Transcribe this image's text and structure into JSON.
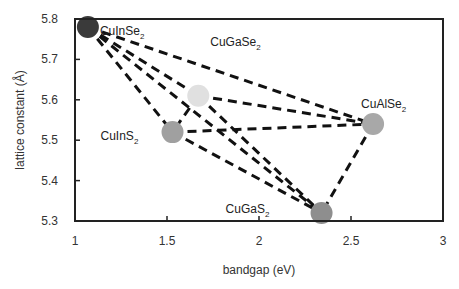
{
  "chart_data": {
    "type": "scatter",
    "title": "",
    "xlabel": "bandgap (eV)",
    "ylabel": "lattice constant (Å)",
    "xlim": [
      1,
      3
    ],
    "ylim": [
      5.3,
      5.8
    ],
    "xticks": [
      1,
      1.5,
      2,
      2.5,
      3
    ],
    "xtick_labels": [
      "1",
      "1.5",
      "2",
      "2.5",
      "3"
    ],
    "yticks": [
      5.3,
      5.4,
      5.5,
      5.6,
      5.7,
      5.8
    ],
    "ytick_labels": [
      "5.3",
      "5.4",
      "5.5",
      "5.6",
      "5.7",
      "5.8"
    ],
    "grid": false,
    "legend": null,
    "points": [
      {
        "name": "CuInSe2",
        "base": "CuInSe",
        "sub": "2",
        "x": 1.07,
        "y": 5.78,
        "color": "#3a3a3a",
        "label_dx": 12,
        "label_dy": 8
      },
      {
        "name": "CuGaSe2",
        "base": "CuGaSe",
        "sub": "2",
        "x": 1.67,
        "y": 5.61,
        "color": "#e0e0e0",
        "label_dx": 12,
        "label_dy": -50
      },
      {
        "name": "CuInS2",
        "base": "CuInS",
        "sub": "2",
        "x": 1.53,
        "y": 5.52,
        "color": "#a0a0a0",
        "label_dx": -72,
        "label_dy": 8
      },
      {
        "name": "CuAlSe2",
        "base": "CuAlSe",
        "sub": "2",
        "x": 2.62,
        "y": 5.54,
        "color": "#a8a8a8",
        "label_dx": -12,
        "label_dy": -16
      },
      {
        "name": "CuGaS2",
        "base": "CuGaS",
        "sub": "2",
        "x": 2.34,
        "y": 5.32,
        "color": "#8e8e8e",
        "label_dx": -96,
        "label_dy": 0
      }
    ],
    "connections": [
      [
        "CuInSe2",
        "CuGaSe2"
      ],
      [
        "CuInSe2",
        "CuInS2"
      ],
      [
        "CuInSe2",
        "CuAlSe2"
      ],
      [
        "CuInSe2",
        "CuGaS2"
      ],
      [
        "CuGaSe2",
        "CuInS2"
      ],
      [
        "CuGaSe2",
        "CuAlSe2"
      ],
      [
        "CuGaSe2",
        "CuGaS2"
      ],
      [
        "CuInS2",
        "CuAlSe2"
      ],
      [
        "CuInS2",
        "CuGaS2"
      ],
      [
        "CuAlSe2",
        "CuGaS2"
      ]
    ],
    "line_style": "dashed",
    "line_color": "#111111"
  }
}
